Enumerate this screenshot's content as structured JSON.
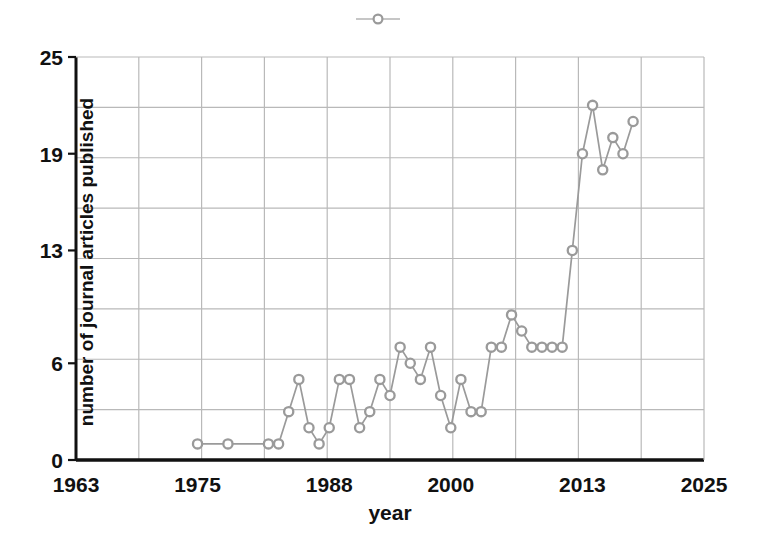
{
  "chart_data": {
    "type": "line",
    "title": "",
    "xlabel": "year",
    "ylabel": "number of journal articles published",
    "xlim": [
      1963,
      2025
    ],
    "ylim": [
      0,
      25
    ],
    "xticks": [
      "1963",
      "1975",
      "1988",
      "2000",
      "2013",
      "2025"
    ],
    "xtick_values": [
      1963,
      1975,
      1988,
      2000,
      2013,
      2025
    ],
    "yticks": [
      "0",
      "6",
      "13",
      "19",
      "25"
    ],
    "ytick_values": [
      0,
      6,
      13,
      19,
      25
    ],
    "grid": "both",
    "legend_position": "top-center",
    "legend_label": "",
    "marker": "circle-open",
    "series_color": "#9a9a9a",
    "axis_color": "#111111",
    "grid_color": "#b9b9b9",
    "background_color": "#ffffff",
    "x": [
      1975,
      1978,
      1982,
      1983,
      1984,
      1985,
      1986,
      1987,
      1988,
      1989,
      1990,
      1991,
      1992,
      1993,
      1994,
      1995,
      1996,
      1997,
      1998,
      1999,
      2000,
      2001,
      2002,
      2003,
      2004,
      2005,
      2006,
      2007,
      2008,
      2009,
      2010,
      2011,
      2012,
      2013,
      2014,
      2015,
      2016,
      2017,
      2018
    ],
    "values": [
      1,
      1,
      1,
      1,
      3,
      5,
      2,
      1,
      2,
      5,
      5,
      2,
      3,
      5,
      4,
      7,
      6,
      5,
      7,
      4,
      2,
      5,
      3,
      3,
      7,
      7,
      9,
      8,
      7,
      7,
      7,
      7,
      13,
      19,
      22,
      18,
      20,
      19,
      21
    ],
    "points": [
      {
        "year": 1975,
        "value": 1
      },
      {
        "year": 1978,
        "value": 1
      },
      {
        "year": 1982,
        "value": 1
      },
      {
        "year": 1983,
        "value": 1
      },
      {
        "year": 1984,
        "value": 3
      },
      {
        "year": 1985,
        "value": 5
      },
      {
        "year": 1986,
        "value": 2
      },
      {
        "year": 1987,
        "value": 1
      },
      {
        "year": 1988,
        "value": 2
      },
      {
        "year": 1989,
        "value": 5
      },
      {
        "year": 1990,
        "value": 5
      },
      {
        "year": 1991,
        "value": 2
      },
      {
        "year": 1992,
        "value": 3
      },
      {
        "year": 1993,
        "value": 5
      },
      {
        "year": 1994,
        "value": 4
      },
      {
        "year": 1995,
        "value": 7
      },
      {
        "year": 1996,
        "value": 6
      },
      {
        "year": 1997,
        "value": 5
      },
      {
        "year": 1998,
        "value": 7
      },
      {
        "year": 1999,
        "value": 4
      },
      {
        "year": 2000,
        "value": 2
      },
      {
        "year": 2001,
        "value": 5
      },
      {
        "year": 2002,
        "value": 3
      },
      {
        "year": 2003,
        "value": 3
      },
      {
        "year": 2004,
        "value": 7
      },
      {
        "year": 2005,
        "value": 7
      },
      {
        "year": 2006,
        "value": 9
      },
      {
        "year": 2007,
        "value": 8
      },
      {
        "year": 2008,
        "value": 7
      },
      {
        "year": 2009,
        "value": 7
      },
      {
        "year": 2010,
        "value": 7
      },
      {
        "year": 2011,
        "value": 7
      },
      {
        "year": 2012,
        "value": 13
      },
      {
        "year": 2013,
        "value": 19
      },
      {
        "year": 2014,
        "value": 22
      },
      {
        "year": 2015,
        "value": 18
      },
      {
        "year": 2016,
        "value": 20
      },
      {
        "year": 2017,
        "value": 19
      },
      {
        "year": 2018,
        "value": 21
      }
    ]
  }
}
